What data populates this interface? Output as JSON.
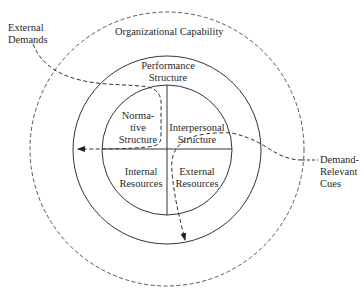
{
  "diagram": {
    "outer_ring_label": "Organizational Capability",
    "middle_ring_label": [
      "Performance",
      "Structure"
    ],
    "quadrants": {
      "top_left": [
        "Norma-",
        "tive",
        "Structure"
      ],
      "top_right": [
        "Interpersonal",
        "Structure"
      ],
      "bottom_left": [
        "Internal",
        "Resources"
      ],
      "bottom_right": [
        "External",
        "Resources"
      ]
    },
    "inputs": {
      "external_demands": [
        "External",
        "Demands"
      ],
      "demand_relevant_cues": [
        "Demand-",
        "Relevant",
        "Cues"
      ]
    },
    "colors": {
      "line": "#333333",
      "background": "#ffffff"
    }
  }
}
